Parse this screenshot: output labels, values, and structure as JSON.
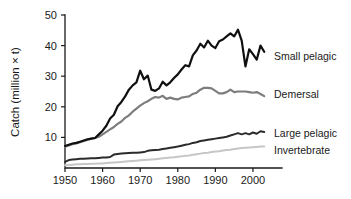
{
  "chart_data": {
    "type": "line",
    "title": "",
    "xlabel": "",
    "ylabel": "Catch (million × t)",
    "xlim": [
      1950,
      2004
    ],
    "ylim": [
      0,
      50
    ],
    "grid": false,
    "legend_position": "right-inline",
    "x_ticks": [
      "1950",
      "1960",
      "1970",
      "1980",
      "1990",
      "2000"
    ],
    "x_tick_values": [
      1950,
      1960,
      1970,
      1980,
      1990,
      2000
    ],
    "y_ticks": [
      "10",
      "20",
      "30",
      "40",
      "50"
    ],
    "y_tick_values": [
      10,
      20,
      30,
      40,
      50
    ],
    "x": [
      1950,
      1951,
      1952,
      1953,
      1954,
      1955,
      1956,
      1957,
      1958,
      1959,
      1960,
      1961,
      1962,
      1963,
      1964,
      1965,
      1966,
      1967,
      1968,
      1969,
      1970,
      1971,
      1972,
      1973,
      1974,
      1975,
      1976,
      1977,
      1978,
      1979,
      1980,
      1981,
      1982,
      1983,
      1984,
      1985,
      1986,
      1987,
      1988,
      1989,
      1990,
      1991,
      1992,
      1993,
      1994,
      1995,
      1996,
      1997,
      1998,
      1999,
      2000,
      2001,
      2002,
      2003
    ],
    "series": [
      {
        "name": "Small pelagic",
        "color": "#101010",
        "line_width": 2.2,
        "values": [
          7.2,
          7.6,
          8.0,
          8.2,
          8.6,
          9.0,
          9.4,
          9.6,
          9.8,
          11.0,
          12.2,
          13.8,
          16.2,
          17.4,
          20.2,
          21.6,
          23.4,
          25.6,
          27.0,
          28.0,
          31.8,
          29.0,
          30.2,
          25.6,
          25.2,
          26.0,
          28.2,
          27.0,
          28.0,
          29.4,
          30.6,
          32.2,
          33.6,
          33.2,
          36.8,
          38.4,
          40.6,
          39.4,
          41.6,
          40.0,
          39.2,
          41.4,
          42.0,
          43.0,
          44.0,
          43.0,
          45.2,
          41.6,
          33.2,
          38.8,
          37.2,
          35.4,
          40.0,
          38.0
        ]
      },
      {
        "name": "Demersal",
        "color": "#7d7d7d",
        "line_width": 2.2,
        "values": [
          7.0,
          7.4,
          7.8,
          8.0,
          8.4,
          8.8,
          9.2,
          9.6,
          9.8,
          10.2,
          11.0,
          11.8,
          12.6,
          13.4,
          14.4,
          15.2,
          16.4,
          17.2,
          18.4,
          19.4,
          20.4,
          21.2,
          21.8,
          22.6,
          23.2,
          23.0,
          23.6,
          22.6,
          23.0,
          22.6,
          22.4,
          23.0,
          23.2,
          23.4,
          24.2,
          24.6,
          25.6,
          26.2,
          26.2,
          26.0,
          25.2,
          24.4,
          24.4,
          24.8,
          25.6,
          24.8,
          25.0,
          25.0,
          25.0,
          24.8,
          24.6,
          24.8,
          24.2,
          23.5
        ]
      },
      {
        "name": "Large pelagic",
        "color": "#2b2b2b",
        "line_width": 2.0,
        "values": [
          2.0,
          2.6,
          2.8,
          2.9,
          3.0,
          3.0,
          3.1,
          3.2,
          3.2,
          3.3,
          3.4,
          3.4,
          3.6,
          4.4,
          4.6,
          4.7,
          4.8,
          4.9,
          5.0,
          5.0,
          5.1,
          5.2,
          5.6,
          5.8,
          5.9,
          6.0,
          6.2,
          6.4,
          6.6,
          6.8,
          7.0,
          7.3,
          7.6,
          7.8,
          8.2,
          8.4,
          8.8,
          9.0,
          9.2,
          9.4,
          9.6,
          9.8,
          10.0,
          10.2,
          10.6,
          11.0,
          11.4,
          11.0,
          11.4,
          11.0,
          11.6,
          11.2,
          12.0,
          11.8
        ]
      },
      {
        "name": "Invertebrate",
        "color": "#c6c6c6",
        "line_width": 2.0,
        "values": [
          0.9,
          1.0,
          1.1,
          1.2,
          1.2,
          1.3,
          1.3,
          1.4,
          1.4,
          1.5,
          1.5,
          1.6,
          1.7,
          1.8,
          1.9,
          2.0,
          2.1,
          2.2,
          2.3,
          2.4,
          2.5,
          2.6,
          2.7,
          2.8,
          2.9,
          3.0,
          3.2,
          3.3,
          3.4,
          3.5,
          3.7,
          3.8,
          4.0,
          4.1,
          4.3,
          4.5,
          4.7,
          4.9,
          5.0,
          5.2,
          5.4,
          5.5,
          5.7,
          5.9,
          6.0,
          6.2,
          6.4,
          6.5,
          6.6,
          6.7,
          6.8,
          6.9,
          7.0,
          7.0
        ]
      }
    ],
    "series_labels": [
      {
        "text": "Small pelagic",
        "x": 274,
        "y": 60
      },
      {
        "text": "Demersal",
        "x": 274,
        "y": 98
      },
      {
        "text": "Large pelagic",
        "x": 274,
        "y": 137
      },
      {
        "text": "Invertebrate",
        "x": 274,
        "y": 154
      }
    ]
  }
}
